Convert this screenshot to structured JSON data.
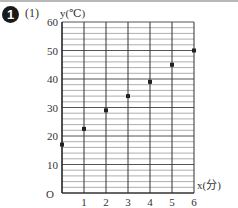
{
  "problem": {
    "number": "1",
    "part": "(1)"
  },
  "chart_data": {
    "type": "scatter",
    "title": "",
    "xlabel": "x(分)",
    "ylabel": "y(℃)",
    "origin_label": "O",
    "x": [
      0,
      1,
      2,
      3,
      4,
      5,
      6
    ],
    "y": [
      17,
      22.5,
      29,
      34,
      39,
      45,
      50
    ],
    "xticks": [
      "1",
      "2",
      "3",
      "4",
      "5",
      "6"
    ],
    "yticks": [
      "10",
      "20",
      "30",
      "40",
      "50",
      "60"
    ],
    "xlim": [
      0,
      6
    ],
    "ylim": [
      0,
      60
    ],
    "grid": {
      "x_major_step": 1,
      "y_major_step": 10,
      "y_minor_step": 2
    }
  }
}
